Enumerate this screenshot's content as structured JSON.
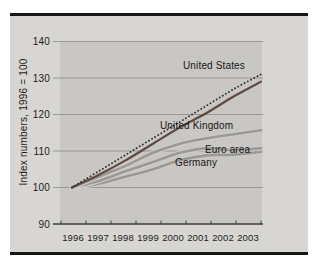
{
  "chart_data": {
    "type": "line",
    "title": "",
    "xlabel": "",
    "ylabel": "Index numbers, 1996 = 100",
    "x": [
      1996,
      1997,
      1998,
      1999,
      2000,
      2001,
      2002,
      2003
    ],
    "ylim": [
      90,
      140
    ],
    "y_ticks": [
      140,
      130,
      120,
      110,
      100,
      90
    ],
    "grid": "horizontal",
    "legend_position": "inline-labels",
    "series": [
      {
        "name": "United States (dotted line)",
        "style": "dotted",
        "color": "#2e2c2a",
        "width": 1.8,
        "values": [
          100,
          104.5,
          109,
          113.5,
          118,
          122.5,
          127,
          131
        ]
      },
      {
        "name": "United States (solid dark line, unlabeled)",
        "style": "solid",
        "color": "#5e4a42",
        "width": 2.2,
        "values": [
          100,
          103.5,
          107.5,
          112,
          116.5,
          120.5,
          125,
          129
        ]
      },
      {
        "name": "United Kingdom",
        "style": "solid",
        "color": "#9b9996",
        "halo": "#cfcdc9",
        "width": 2.6,
        "values": [
          100,
          103,
          106,
          109.5,
          112,
          113.5,
          114.6,
          115.7
        ]
      },
      {
        "name": "Euro area",
        "style": "solid",
        "color": "#9b9996",
        "halo": "#cfcdc9",
        "width": 2.6,
        "values": [
          100,
          101.8,
          104.5,
          107,
          109.5,
          110.8,
          110.2,
          110.8
        ]
      },
      {
        "name": "Germany",
        "style": "solid",
        "color": "#9b9996",
        "halo": "#cfcdc9",
        "width": 2.6,
        "values": [
          100,
          101,
          103,
          105,
          107.5,
          108.8,
          109,
          109.8
        ]
      }
    ],
    "annotations": [
      {
        "text": "United States"
      },
      {
        "text": "United Kingdom"
      },
      {
        "text": "Euro area"
      },
      {
        "text": "Germany"
      }
    ]
  },
  "colors": {
    "outer_panel": "#d8d6d2",
    "plot_panel": "#c9c7c3",
    "frame_bar": "#161616",
    "gridline": "#8d8b88",
    "axis": "#3e3e3e",
    "text": "#1c1c1c"
  }
}
